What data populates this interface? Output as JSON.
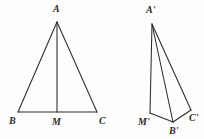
{
  "page": {
    "background_color": "#fdfdfc",
    "ink_color": "#2b2b2b",
    "width": 204,
    "height": 139
  },
  "figures": [
    {
      "id": "triangle-abc",
      "name": "isosceles-triangle-with-median",
      "vertices": [
        {
          "key": "A",
          "label": "A",
          "x": 57,
          "y": 22,
          "label_x": 53,
          "label_y": 4,
          "role": "apex"
        },
        {
          "key": "B",
          "label": "B",
          "x": 18,
          "y": 112,
          "label_x": 9,
          "label_y": 116,
          "role": "base-left"
        },
        {
          "key": "M",
          "label": "M",
          "x": 57,
          "y": 112,
          "label_x": 52,
          "label_y": 117,
          "role": "base-midpoint"
        },
        {
          "key": "C",
          "label": "C",
          "x": 97,
          "y": 112,
          "label_x": 99,
          "label_y": 116,
          "role": "base-right"
        }
      ],
      "segments": [
        {
          "name": "side-AB",
          "from": "A",
          "to": "B"
        },
        {
          "name": "side-AC",
          "from": "A",
          "to": "C"
        },
        {
          "name": "base-BC",
          "from": "B",
          "to": "C"
        },
        {
          "name": "median-AM",
          "from": "A",
          "to": "M"
        }
      ]
    },
    {
      "id": "triangle-a-prime-b-prime-c-prime",
      "name": "skewed-triangle-with-median",
      "vertices": [
        {
          "key": "A1",
          "label": "A'",
          "x": 152,
          "y": 24,
          "label_x": 146,
          "label_y": 5,
          "role": "apex"
        },
        {
          "key": "M1",
          "label": "M'",
          "x": 150,
          "y": 113,
          "label_x": 138,
          "label_y": 117,
          "role": "base-midpoint"
        },
        {
          "key": "B1",
          "label": "B'",
          "x": 173,
          "y": 122,
          "label_x": 169,
          "label_y": 126,
          "role": "base-left"
        },
        {
          "key": "C1",
          "label": "C'",
          "x": 191,
          "y": 110,
          "label_x": 189,
          "label_y": 113,
          "role": "base-right"
        }
      ],
      "segments": [
        {
          "name": "median-A1M1",
          "from": "A1",
          "to": "M1"
        },
        {
          "name": "side-A1B1",
          "from": "A1",
          "to": "B1"
        },
        {
          "name": "side-A1C1",
          "from": "A1",
          "to": "C1"
        },
        {
          "name": "base-M1B1",
          "from": "M1",
          "to": "B1"
        },
        {
          "name": "base-B1C1",
          "from": "B1",
          "to": "C1"
        }
      ]
    }
  ]
}
